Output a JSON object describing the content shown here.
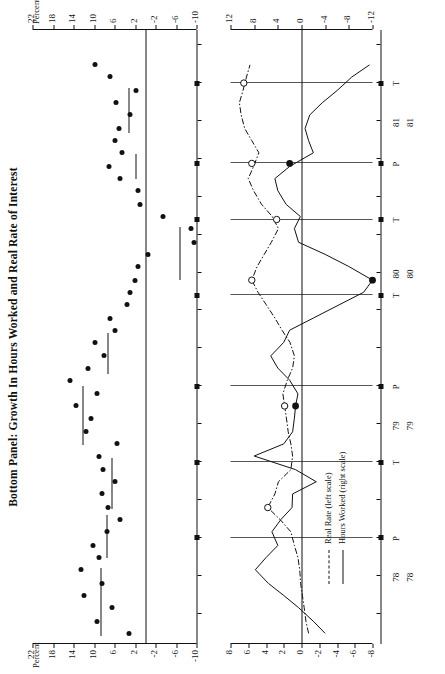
{
  "title": "Bottom Panel:  Growth In Hours Worked and Real Rate of Interest",
  "panel1": {
    "axis_name_left": "Percent",
    "axis_name_right": "Percent",
    "y_ticks": [
      "22",
      "18",
      "14",
      "10",
      "6",
      "2",
      "-2",
      "-6",
      "-10"
    ],
    "y_values": [
      22,
      18,
      14,
      10,
      6,
      2,
      -2,
      -6,
      -10
    ],
    "ylim": [
      -10,
      22
    ],
    "x_year_labels": [
      "78",
      "79",
      "80",
      "81"
    ],
    "x_year_positions": [
      1978.0,
      1979.0,
      1980.0,
      1981.0
    ]
  },
  "panel2": {
    "y_left_ticks": [
      "8",
      "6",
      "4",
      "2",
      "0",
      "-2",
      "-4",
      "-6",
      "-8"
    ],
    "y_left_values": [
      8,
      6,
      4,
      2,
      0,
      -2,
      -4,
      -6,
      -8
    ],
    "y_right_ticks": [
      "12",
      "8",
      "4",
      "0",
      "-4",
      "-8",
      "-12"
    ],
    "y_right_values": [
      12,
      8,
      4,
      0,
      -4,
      -8,
      -12
    ],
    "x_year_labels": [
      "78",
      "79",
      "80",
      "81"
    ],
    "legend": [
      {
        "label": "Real Rate (left scale)",
        "style": "dash-dot"
      },
      {
        "label": "Hours Worked (right scale)",
        "style": "solid"
      }
    ],
    "cycle_markers": [
      {
        "label": "P",
        "x": 1978.25
      },
      {
        "label": "T",
        "x": 1978.75
      },
      {
        "label": "P",
        "x": 1979.25
      },
      {
        "label": "T",
        "x": 1979.85
      },
      {
        "label": "T",
        "x": 1980.35
      },
      {
        "label": "P",
        "x": 1980.72
      },
      {
        "label": "T",
        "x": 1981.25
      }
    ]
  },
  "chart_data": [
    {
      "type": "scatter",
      "title": "Bottom Panel:  Growth In Hours Worked and Real Rate of Interest",
      "panel": "upper-scatter",
      "xlabel": "",
      "ylabel": "Percent",
      "ylim": [
        -10,
        22
      ],
      "xlim": [
        1977.55,
        1981.6
      ],
      "yticks": [
        22,
        18,
        14,
        10,
        6,
        2,
        -2,
        -6,
        -10
      ],
      "xticks": [
        1978,
        1979,
        1980,
        1981
      ],
      "grid": false,
      "series": [
        {
          "name": "Hours Worked Growth",
          "marker": "filled-circle",
          "x": [
            1977.62,
            1977.7,
            1977.79,
            1977.87,
            1977.95,
            1978.04,
            1978.12,
            1978.2,
            1978.29,
            1978.37,
            1978.45,
            1978.54,
            1978.62,
            1978.7,
            1978.79,
            1978.87,
            1978.95,
            1979.04,
            1979.12,
            1979.2,
            1979.29,
            1979.37,
            1979.45,
            1979.54,
            1979.62,
            1979.7,
            1979.79,
            1979.87,
            1979.95,
            1980.04,
            1980.12,
            1980.2,
            1980.29,
            1980.37,
            1980.45,
            1980.54,
            1980.62,
            1980.7,
            1980.79,
            1980.87,
            1980.95,
            1981.04,
            1981.12,
            1981.2,
            1981.29,
            1981.37
          ],
          "y": [
            3.2,
            9.5,
            6.5,
            12.0,
            8.5,
            12.5,
            9.0,
            10.2,
            7.4,
            5.0,
            7.2,
            8.5,
            6.0,
            8.2,
            9.0,
            5.6,
            11.5,
            10.5,
            13.5,
            9.5,
            14.7,
            11.2,
            8.0,
            9.8,
            6.0,
            6.8,
            3.5,
            3.0,
            2.0,
            1.5,
            -0.5,
            -9.5,
            -9.0,
            -3.5,
            1.0,
            1.5,
            5.0,
            7.0,
            4.5,
            6.0,
            5.2,
            3.0,
            5.8,
            1.8,
            6.8,
            9.8
          ]
        }
      ],
      "average_segments": [
        {
          "x_start": 1977.6,
          "x_end": 1978.05,
          "y": 8.8
        },
        {
          "x_start": 1978.12,
          "x_end": 1978.4,
          "y": 7.6
        },
        {
          "x_start": 1978.44,
          "x_end": 1978.78,
          "y": 6.6
        },
        {
          "x_start": 1978.86,
          "x_end": 1979.25,
          "y": 12.3
        },
        {
          "x_start": 1979.33,
          "x_end": 1979.6,
          "y": 7.4
        },
        {
          "x_start": 1979.95,
          "x_end": 1980.3,
          "y": -6.6
        },
        {
          "x_start": 1980.62,
          "x_end": 1980.78,
          "y": 2.0
        },
        {
          "x_start": 1980.92,
          "x_end": 1981.22,
          "y": 3.2
        }
      ]
    },
    {
      "type": "line",
      "panel": "lower-dual-axis",
      "xlabel": "",
      "ylabel_left": "",
      "ylabel_right": "",
      "ylim_left": [
        -8,
        8
      ],
      "ylim_right": [
        -12,
        12
      ],
      "xlim": [
        1977.55,
        1981.6
      ],
      "grid": true,
      "series": [
        {
          "name": "Real Rate (left scale)",
          "axis": "left",
          "style": "dash-dot",
          "x": [
            1977.62,
            1977.7,
            1977.79,
            1977.87,
            1977.95,
            1978.04,
            1978.12,
            1978.2,
            1978.29,
            1978.37,
            1978.45,
            1978.54,
            1978.62,
            1978.7,
            1978.79,
            1978.87,
            1978.95,
            1979.04,
            1979.12,
            1979.2,
            1979.29,
            1979.37,
            1979.45,
            1979.54,
            1979.62,
            1979.7,
            1979.79,
            1979.87,
            1979.95,
            1980.04,
            1980.12,
            1980.2,
            1980.29,
            1980.37,
            1980.45,
            1980.54,
            1980.62,
            1980.7,
            1980.79,
            1980.87,
            1980.95,
            1981.04,
            1981.12,
            1981.2,
            1981.29,
            1981.37
          ],
          "y": [
            -0.8,
            -0.5,
            -0.3,
            -0.1,
            0.1,
            0.2,
            0.4,
            0.8,
            1.2,
            2.4,
            3.8,
            3.0,
            2.6,
            1.2,
            1.0,
            1.2,
            1.5,
            1.7,
            1.9,
            2.1,
            1.6,
            1.0,
            0.8,
            1.3,
            2.2,
            3.0,
            4.0,
            4.9,
            5.6,
            5.0,
            4.2,
            3.4,
            2.6,
            3.3,
            4.5,
            5.4,
            6.0,
            5.4,
            4.8,
            5.6,
            6.4,
            6.8,
            7.0,
            6.6,
            6.2,
            5.8
          ],
          "highlight_points": [
            {
              "x": 1978.45,
              "y": 3.8,
              "marker": "open-circle"
            },
            {
              "x": 1979.12,
              "y": 1.9,
              "marker": "open-circle"
            },
            {
              "x": 1979.95,
              "y": 5.6,
              "marker": "open-circle"
            },
            {
              "x": 1980.35,
              "y": 2.8,
              "marker": "open-circle"
            },
            {
              "x": 1980.72,
              "y": 5.6,
              "marker": "open-circle"
            },
            {
              "x": 1981.25,
              "y": 6.5,
              "marker": "open-circle"
            }
          ]
        },
        {
          "name": "Hours Worked (right scale)",
          "axis": "right",
          "style": "solid",
          "x": [
            1977.62,
            1977.7,
            1977.79,
            1977.87,
            1977.95,
            1978.04,
            1978.12,
            1978.2,
            1978.29,
            1978.37,
            1978.45,
            1978.54,
            1978.62,
            1978.7,
            1978.79,
            1978.87,
            1978.95,
            1979.04,
            1979.12,
            1979.2,
            1979.29,
            1979.37,
            1979.45,
            1979.54,
            1979.62,
            1979.7,
            1979.79,
            1979.87,
            1979.95,
            1980.04,
            1980.12,
            1980.2,
            1980.29,
            1980.37,
            1980.45,
            1980.54,
            1980.62,
            1980.7,
            1980.79,
            1980.87,
            1980.95,
            1981.04,
            1981.12,
            1981.2,
            1981.29,
            1981.37
          ],
          "y": [
            -4.0,
            -2.0,
            0.5,
            3.0,
            5.6,
            7.8,
            6.0,
            4.0,
            5.0,
            3.5,
            1.6,
            1.5,
            -2.5,
            1.0,
            8.0,
            3.0,
            1.5,
            1.2,
            1.0,
            0.6,
            2.0,
            4.0,
            5.2,
            3.0,
            2.0,
            -2.0,
            -6.5,
            -10.5,
            -12.0,
            -8.0,
            -4.0,
            0.5,
            1.2,
            0.2,
            2.6,
            4.0,
            4.5,
            2.0,
            -2.0,
            -1.2,
            -0.6,
            -1.4,
            -3.5,
            -6.0,
            -8.5,
            -11.5
          ],
          "highlight_points": [
            {
              "x": 1979.12,
              "y": 1.0,
              "marker": "filled-circle"
            },
            {
              "x": 1979.95,
              "y": -12.0,
              "marker": "filled-circle"
            },
            {
              "x": 1980.72,
              "y": 2.0,
              "marker": "filled-circle"
            }
          ]
        }
      ],
      "legend": [
        "Real Rate (left scale)",
        "Hours Worked (right scale)"
      ],
      "legend_position": "bottom-left"
    }
  ]
}
